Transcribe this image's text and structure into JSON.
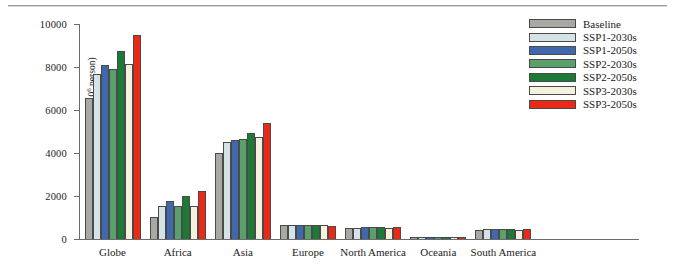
{
  "chart_data": {
    "type": "bar",
    "title": "",
    "xlabel": "",
    "ylabel": "Projections of populations (10⁶ person)",
    "ylabel_prefix": "Projections of populations (10",
    "ylabel_sup": "6",
    "ylabel_suffix": " person)",
    "ylim": [
      0,
      10000
    ],
    "ytick_labels": [
      "10000",
      "8000",
      "6000",
      "4000",
      "2000",
      "0"
    ],
    "ytick_values": [
      10000,
      8000,
      6000,
      4000,
      2000,
      0
    ],
    "grid": false,
    "legend_position": "top-right",
    "categories": [
      "Globe",
      "Africa",
      "Asia",
      "Europe",
      "North America",
      "Oceania",
      "South America"
    ],
    "series": [
      {
        "name": "Baseline",
        "color": "#a8a8a4",
        "values": [
          6580,
          1020,
          4000,
          640,
          500,
          42,
          420
        ]
      },
      {
        "name": "SSP1-2030s",
        "color": "#d5e3e6",
        "values": [
          7660,
          1540,
          4520,
          660,
          530,
          45,
          450
        ]
      },
      {
        "name": "SSP1-2050s",
        "color": "#4068ad",
        "values": [
          8090,
          1760,
          4600,
          650,
          560,
          46,
          460
        ]
      },
      {
        "name": "SSP2-2030s",
        "color": "#59a06a",
        "values": [
          7930,
          1520,
          4660,
          670,
          540,
          44,
          450
        ]
      },
      {
        "name": "SSP2-2050s",
        "color": "#1a7a36",
        "values": [
          8760,
          1990,
          4940,
          660,
          580,
          45,
          470
        ]
      },
      {
        "name": "SSP3-2030s",
        "color": "#f5f1de",
        "values": [
          8120,
          1540,
          4740,
          640,
          530,
          43,
          440
        ]
      },
      {
        "name": "SSP3-2050s",
        "color": "#ea2a16",
        "values": [
          9480,
          2230,
          5400,
          610,
          560,
          42,
          480
        ]
      }
    ]
  },
  "legend": {
    "items": [
      {
        "label": "Baseline"
      },
      {
        "label": "SSP1-2030s"
      },
      {
        "label": "SSP1-2050s"
      },
      {
        "label": "SSP2-2030s"
      },
      {
        "label": "SSP2-2050s"
      },
      {
        "label": "SSP3-2030s"
      },
      {
        "label": "SSP3-2050s"
      }
    ]
  }
}
